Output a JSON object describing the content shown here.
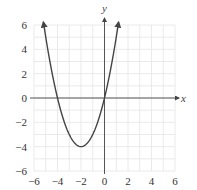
{
  "chart_data": {
    "type": "line",
    "title": "",
    "xlabel": "x",
    "ylabel": "y",
    "xlim": [
      -6,
      6
    ],
    "ylim": [
      -6,
      6
    ],
    "grid": true,
    "grid_step": 1,
    "x_ticks": [
      -6,
      -4,
      -2,
      0,
      2,
      4,
      6
    ],
    "y_ticks": [
      -6,
      -4,
      -2,
      0,
      2,
      4,
      6
    ],
    "x_tick_labels": [
      "−6",
      "−4",
      "−2",
      "0",
      "2",
      "4",
      "6"
    ],
    "y_tick_labels": [
      "−6",
      "−4",
      "−2",
      "0",
      "2",
      "4",
      "6"
    ],
    "series": [
      {
        "name": "parabola",
        "equation": "y = x^2 + 4x",
        "vertex": [
          -2,
          -4
        ],
        "x_intercepts": [
          -4,
          0
        ],
        "x_range": [
          -5.2,
          1.2
        ],
        "arrows_at_ends": true,
        "x": [
          -5.2,
          -5,
          -4.5,
          -4,
          -3.5,
          -3,
          -2.5,
          -2,
          -1.5,
          -1,
          -0.5,
          0,
          0.5,
          1,
          1.2
        ],
        "values": [
          6.24,
          5,
          2.25,
          0,
          -1.75,
          -3,
          -3.75,
          -4,
          -3.75,
          -3,
          -1.75,
          0,
          2.25,
          5,
          6.24
        ]
      }
    ]
  },
  "colors": {
    "curve": "#444444",
    "axis": "#555555",
    "grid": "#e4e4e4"
  }
}
